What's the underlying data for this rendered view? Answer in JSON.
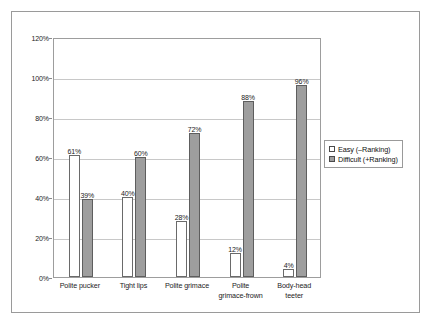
{
  "chart_data": {
    "type": "bar",
    "title": "",
    "subtitle": "",
    "xlabel": "",
    "ylabel": "",
    "ylim": [
      0,
      120
    ],
    "ytick_labels": [
      "0%",
      "20%",
      "40%",
      "60%",
      "80%",
      "100%",
      "120%"
    ],
    "ytick_values": [
      0,
      20,
      40,
      60,
      80,
      100,
      120
    ],
    "grid": true,
    "legend_position": "right",
    "categories": [
      "Polite pucker",
      "Tight lips",
      "Polite grimace",
      "Polite grimace-frown",
      "Body-head teeter"
    ],
    "category_lines": [
      [
        "Polite pucker"
      ],
      [
        "Tight lips"
      ],
      [
        "Polite grimace"
      ],
      [
        "Polite",
        "grimace-frown"
      ],
      [
        "Body-head",
        "teeter"
      ]
    ],
    "series": [
      {
        "name": "Easy (–Ranking)",
        "color": "#ffffff",
        "values": [
          61,
          40,
          28,
          12,
          4
        ],
        "labels": [
          "61%",
          "40%",
          "28%",
          "12%",
          "4%"
        ]
      },
      {
        "name": "Difficult (+Ranking)",
        "color": "#9e9e9e",
        "values": [
          39,
          60,
          72,
          88,
          96
        ],
        "labels": [
          "39%",
          "60%",
          "72%",
          "88%",
          "96%"
        ]
      }
    ]
  },
  "legend": {
    "items": [
      {
        "label": "Easy (–Ranking)",
        "swatch": "easy"
      },
      {
        "label": "Difficult (+Ranking)",
        "swatch": "difficult"
      }
    ]
  }
}
